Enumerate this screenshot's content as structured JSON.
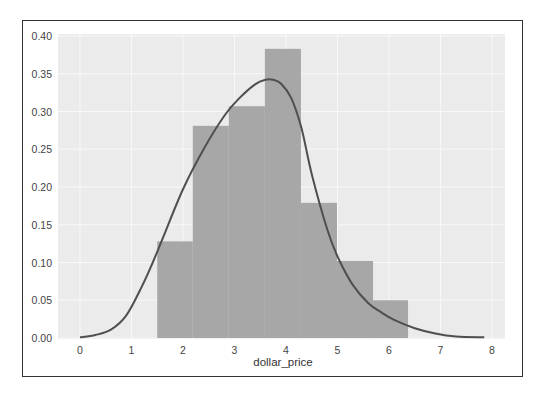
{
  "chart_data": {
    "type": "bar",
    "subtype": "histogram_with_kde",
    "title": "",
    "xlabel": "dollar_price",
    "ylabel": "",
    "xlim": [
      -0.3,
      8.2
    ],
    "ylim": [
      0.0,
      0.4
    ],
    "x_ticks": [
      "0",
      "1",
      "2",
      "3",
      "4",
      "5",
      "6",
      "7",
      "8"
    ],
    "y_ticks": [
      "0.00",
      "0.05",
      "0.10",
      "0.15",
      "0.20",
      "0.25",
      "0.30",
      "0.35",
      "0.40"
    ],
    "grid": true,
    "legend": null,
    "bins": [
      {
        "x0": 1.5,
        "x1": 2.19,
        "density": 0.128
      },
      {
        "x0": 2.19,
        "x1": 2.89,
        "density": 0.281
      },
      {
        "x0": 2.89,
        "x1": 3.59,
        "density": 0.307
      },
      {
        "x0": 3.59,
        "x1": 4.29,
        "density": 0.383
      },
      {
        "x0": 4.29,
        "x1": 4.99,
        "density": 0.179
      },
      {
        "x0": 4.99,
        "x1": 5.69,
        "density": 0.102
      },
      {
        "x0": 5.69,
        "x1": 6.37,
        "density": 0.05
      }
    ],
    "kde": {
      "x": [
        0.0,
        0.3,
        0.6,
        0.9,
        1.2,
        1.4,
        1.6,
        2.0,
        2.4,
        2.8,
        3.1,
        3.4,
        3.6,
        3.75,
        3.9,
        4.1,
        4.3,
        4.5,
        4.8,
        5.0,
        5.3,
        5.6,
        5.85,
        6.1,
        6.5,
        6.9,
        7.3,
        7.85
      ],
      "y": [
        0.001,
        0.004,
        0.011,
        0.03,
        0.068,
        0.098,
        0.131,
        0.197,
        0.25,
        0.294,
        0.318,
        0.336,
        0.342,
        0.342,
        0.337,
        0.318,
        0.278,
        0.217,
        0.144,
        0.108,
        0.07,
        0.046,
        0.034,
        0.024,
        0.013,
        0.006,
        0.002,
        0.001
      ]
    },
    "colors": {
      "plot_bg": "#ebebeb",
      "grid": "#f8f8f8",
      "bars": "#a7a7a7",
      "kde_line": "#4f4f4f"
    }
  }
}
